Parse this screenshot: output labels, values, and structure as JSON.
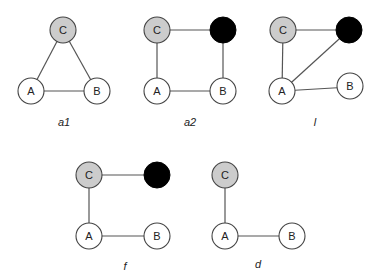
{
  "diagram": {
    "colors": {
      "white_node": "#ffffff",
      "gray_node": "#cccccc",
      "black_node": "#000000",
      "edge": "#555555"
    },
    "graphs": [
      {
        "caption": "a1",
        "nodes": [
          {
            "id": "C",
            "label": "C",
            "fill": "gray"
          },
          {
            "id": "A",
            "label": "A",
            "fill": "white"
          },
          {
            "id": "B",
            "label": "B",
            "fill": "white"
          }
        ],
        "edges": [
          [
            "C",
            "A"
          ],
          [
            "C",
            "B"
          ],
          [
            "A",
            "B"
          ]
        ]
      },
      {
        "caption": "a2",
        "nodes": [
          {
            "id": "C",
            "label": "C",
            "fill": "gray"
          },
          {
            "id": "X",
            "label": "",
            "fill": "black"
          },
          {
            "id": "A",
            "label": "A",
            "fill": "white"
          },
          {
            "id": "B",
            "label": "B",
            "fill": "white"
          }
        ],
        "edges": [
          [
            "C",
            "X"
          ],
          [
            "C",
            "A"
          ],
          [
            "X",
            "B"
          ],
          [
            "A",
            "B"
          ]
        ]
      },
      {
        "caption": "l",
        "nodes": [
          {
            "id": "C",
            "label": "C",
            "fill": "gray"
          },
          {
            "id": "X",
            "label": "",
            "fill": "black"
          },
          {
            "id": "A",
            "label": "A",
            "fill": "white"
          },
          {
            "id": "B",
            "label": "B",
            "fill": "white"
          }
        ],
        "edges": [
          [
            "C",
            "X"
          ],
          [
            "C",
            "A"
          ],
          [
            "A",
            "X"
          ],
          [
            "A",
            "B"
          ]
        ]
      },
      {
        "caption": "f",
        "nodes": [
          {
            "id": "C",
            "label": "C",
            "fill": "gray"
          },
          {
            "id": "X",
            "label": "",
            "fill": "black"
          },
          {
            "id": "A",
            "label": "A",
            "fill": "white"
          },
          {
            "id": "B",
            "label": "B",
            "fill": "white"
          }
        ],
        "edges": [
          [
            "C",
            "X"
          ],
          [
            "C",
            "A"
          ],
          [
            "A",
            "B"
          ]
        ]
      },
      {
        "caption": "d",
        "nodes": [
          {
            "id": "C",
            "label": "C",
            "fill": "gray"
          },
          {
            "id": "A",
            "label": "A",
            "fill": "white"
          },
          {
            "id": "B",
            "label": "B",
            "fill": "white"
          }
        ],
        "edges": [
          [
            "C",
            "A"
          ],
          [
            "A",
            "B"
          ]
        ]
      }
    ]
  }
}
